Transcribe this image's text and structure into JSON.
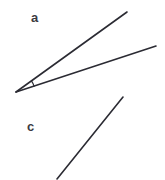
{
  "figure": {
    "background_color": "#ffffff",
    "stroke_color": "#2b2b33",
    "label_color": "#3a3a42",
    "width": 165,
    "height": 180,
    "labels": {
      "angle_label": "a",
      "segment_label": "c"
    },
    "angle_a": {
      "name": "angle-a",
      "vertex": {
        "x": 16,
        "y": 92
      },
      "ray_upper_end": {
        "x": 127,
        "y": 12
      },
      "ray_lower_end": {
        "x": 156,
        "y": 46
      },
      "arc_radius": 19,
      "stroke_width": 1.6
    },
    "segment_c": {
      "name": "segment-c",
      "start": {
        "x": 57,
        "y": 179
      },
      "end": {
        "x": 123,
        "y": 97
      },
      "stroke_width": 1.6
    }
  }
}
